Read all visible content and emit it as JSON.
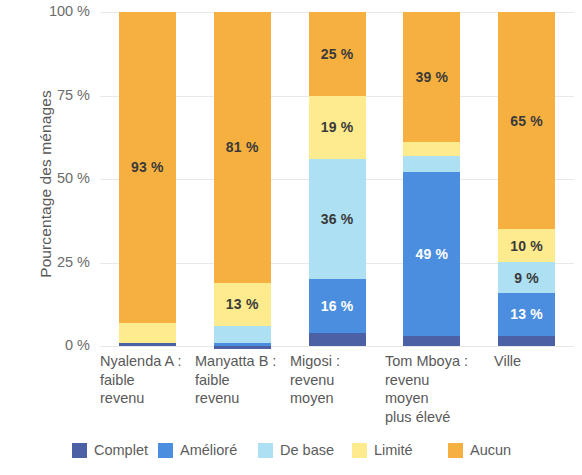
{
  "chart_data": {
    "type": "bar",
    "subtype": "stacked-bar-100",
    "title": "",
    "xlabel": "",
    "ylabel": "Pourcentage des ménages",
    "ylim": [
      0,
      100
    ],
    "ytick_labels": [
      "100 %",
      "75 %",
      "50 %",
      "25 %",
      "0 %"
    ],
    "ytick_values": [
      100,
      75,
      50,
      25,
      0
    ],
    "grid": true,
    "legend_position": "bottom",
    "categories": [
      "Nyalenda A : faible revenu",
      "Manyatta B : faible revenu",
      "Migosi : revenu moyen",
      "Tom Mboya : revenu moyen plus élevé",
      "Ville"
    ],
    "category_lines": [
      [
        "Nyalenda A :",
        "faible",
        "revenu"
      ],
      [
        "Manyatta B :",
        "faible",
        "revenu"
      ],
      [
        "Migosi :",
        "revenu",
        "moyen"
      ],
      [
        "Tom Mboya :",
        "revenu",
        "moyen",
        "plus élevé"
      ],
      [
        "Ville"
      ]
    ],
    "series": [
      {
        "name": "Complet",
        "color": "#4c61a5",
        "values": [
          1,
          1,
          4,
          3,
          3
        ]
      },
      {
        "name": "Amélioré",
        "color": "#4b8ee0",
        "values": [
          0,
          1,
          16,
          49,
          13
        ]
      },
      {
        "name": "De base",
        "color": "#ade0f2",
        "values": [
          0,
          5,
          36,
          5,
          9
        ]
      },
      {
        "name": "Limité",
        "color": "#fdeb8e",
        "values": [
          6,
          13,
          19,
          4,
          10
        ]
      },
      {
        "name": "Aucun",
        "color": "#f6b040",
        "values": [
          93,
          81,
          25,
          39,
          65
        ]
      }
    ],
    "value_labels": {
      "Nyalenda A : faible revenu": {
        "Aucun": "93 %"
      },
      "Manyatta B : faible revenu": {
        "Aucun": "81 %",
        "Limité": "13 %"
      },
      "Migosi : revenu moyen": {
        "Aucun": "25 %",
        "Limité": "19 %",
        "De base": "36 %",
        "Amélioré": "16 %"
      },
      "Tom Mboya : revenu moyen plus élevé": {
        "Aucun": "39 %",
        "Amélioré": "49 %"
      },
      "Ville": {
        "Aucun": "65 %",
        "Limité": "10 %",
        "De base": "9 %",
        "Amélioré": "13 %"
      }
    },
    "legend": [
      {
        "label": "Complet",
        "color": "#4c61a5"
      },
      {
        "label": "Amélioré",
        "color": "#4b8ee0"
      },
      {
        "label": "De base",
        "color": "#ade0f2"
      },
      {
        "label": "Limité",
        "color": "#fdeb8e"
      },
      {
        "label": "Aucun",
        "color": "#f6b040"
      }
    ]
  },
  "axis": {
    "y_title": "Pourcentage des ménages",
    "ticks": [
      {
        "label": "100 %"
      },
      {
        "label": "75 %"
      },
      {
        "label": "50 %"
      },
      {
        "label": "25 %"
      },
      {
        "label": "0 %"
      }
    ]
  },
  "separators": [
    ":",
    ":",
    ":",
    ":"
  ]
}
